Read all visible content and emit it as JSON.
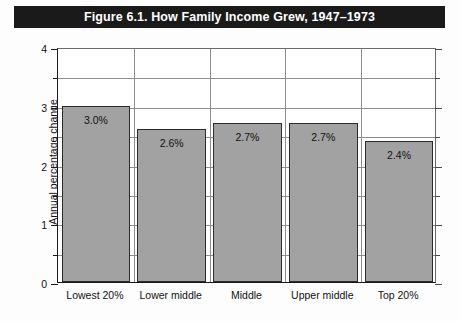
{
  "figure": {
    "title": "Figure 6.1. How Family Income Grew, 1947–1973",
    "title_bar_color": "#1a1a1a",
    "title_text_color": "#ffffff",
    "background_color": "#fdfdfd"
  },
  "chart_data": {
    "type": "bar",
    "title": "Figure 6.1. How Family Income Grew, 1947–1973",
    "categories": [
      "Lowest 20%",
      "Lower middle",
      "Middle",
      "Upper middle",
      "Top 20%"
    ],
    "values": [
      3.0,
      2.6,
      2.7,
      2.7,
      2.4
    ],
    "data_labels": [
      "3.0%",
      "2.6%",
      "2.7%",
      "2.7%",
      "2.4%"
    ],
    "xlabel": "",
    "ylabel": "Annual percentage change",
    "ylim": [
      0,
      4
    ],
    "ytick_labels": [
      "0",
      "1",
      "2",
      "3",
      "4"
    ],
    "ytick_values": [
      0,
      1,
      2,
      3,
      4
    ],
    "yminor_values": [
      0.5,
      1.5,
      2.5,
      3.5
    ],
    "grid": "horizontal-and-vertical",
    "legend": "none",
    "bar_color": "#a2a2a2",
    "bar_edge_color": "#2b2b2b"
  }
}
